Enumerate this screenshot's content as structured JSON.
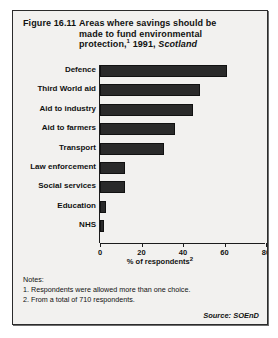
{
  "figure": {
    "number": "Figure 16.11",
    "title_line1": "Areas where savings should be",
    "title_line2": "made to fund environmental",
    "title_line3_main": "protection,",
    "title_line3_sup": "1",
    "title_line3_year": " 1991, ",
    "title_line3_place": "Scotland"
  },
  "chart_data": {
    "type": "bar",
    "orientation": "horizontal",
    "title": "Figure 16.11 Areas where savings should be made to fund environmental protection,1 1991, Scotland",
    "categories": [
      "Defence",
      "Third World aid",
      "Aid to industry",
      "Aid to farmers",
      "Transport",
      "Law enforcement",
      "Social services",
      "Education",
      "NHS"
    ],
    "values": [
      61,
      48,
      45,
      36,
      31,
      12,
      12,
      3,
      2
    ],
    "xlabel": "% of respondents",
    "xlabel_sup": "2",
    "ylabel": "",
    "xlim": [
      0,
      80
    ],
    "xticks": [
      0,
      20,
      40,
      60,
      80
    ],
    "xtick_labels": [
      "0",
      "20",
      "40",
      "60",
      "80"
    ],
    "grid": false,
    "legend": "none",
    "bar_color": "#2a2a2a"
  },
  "notes": {
    "heading": "Notes:",
    "items": [
      "1. Respondents were allowed more than one choice.",
      "2. From a total of 710 respondents."
    ]
  },
  "source": "Source: SOEnD"
}
